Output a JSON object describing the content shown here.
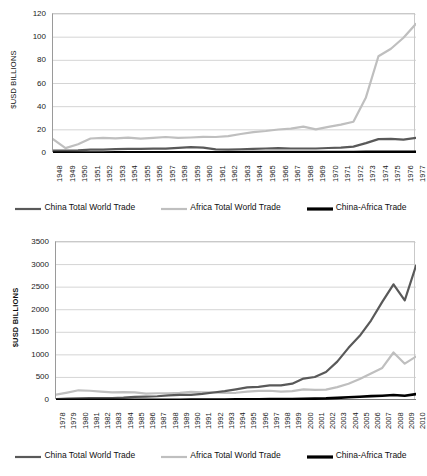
{
  "colors": {
    "china": "#595959",
    "africa": "#bfbfbf",
    "china_africa": "#000000",
    "gridline": "#c9c9c9",
    "axis": "#8c8c8c",
    "text": "#1a1a1a",
    "background": "#ffffff"
  },
  "legend": {
    "items": [
      {
        "label": "China Total World Trade",
        "color_key": "china",
        "thickness": 2.2
      },
      {
        "label": "Africa Total World Trade",
        "color_key": "africa",
        "thickness": 2.2
      },
      {
        "label": "China-Africa Trade",
        "color_key": "china_africa",
        "thickness": 3.2
      }
    ]
  },
  "chart_data": [
    {
      "id": "chart-1948-1977",
      "type": "line",
      "title": "",
      "xlabel": "",
      "ylabel": "$USD BILLIONS",
      "ylim": [
        0,
        120
      ],
      "yticks": [
        0,
        20,
        40,
        60,
        80,
        100,
        120
      ],
      "grid": true,
      "legend_position": "bottom",
      "categories": [
        "1948",
        "1949",
        "1950",
        "1951",
        "1952",
        "1953",
        "1954",
        "1955",
        "1956",
        "1957",
        "1958",
        "1959",
        "1960",
        "1961",
        "1962",
        "1963",
        "1964",
        "1965",
        "1966",
        "1967",
        "1968",
        "1969",
        "1970",
        "1971",
        "1972",
        "1973",
        "1974",
        "1975",
        "1976",
        "1977"
      ],
      "series": [
        {
          "name": "China Total World Trade",
          "color_key": "china",
          "values": [
            2.1,
            2.0,
            2.2,
            3.0,
            3.0,
            3.4,
            3.5,
            3.6,
            3.8,
            3.8,
            4.5,
            5.0,
            4.6,
            3.1,
            3.0,
            3.2,
            3.5,
            3.9,
            4.2,
            3.9,
            3.9,
            3.9,
            4.3,
            4.7,
            5.5,
            8.5,
            12.0,
            12.2,
            11.5,
            13.0
          ]
        },
        {
          "name": "Africa Total World Trade",
          "color_key": "africa",
          "values": [
            12.0,
            4.2,
            7.5,
            12.5,
            13.0,
            12.6,
            13.2,
            12.4,
            13.0,
            13.8,
            13.0,
            13.4,
            14.0,
            13.8,
            14.6,
            16.4,
            18.0,
            19.0,
            20.3,
            21.0,
            22.8,
            20.4,
            22.5,
            24.5,
            27.0,
            48.0,
            83.5,
            90.0,
            99.5,
            111.5
          ]
        },
        {
          "name": "China-Africa Trade",
          "color_key": "china_africa",
          "values": [
            0.3,
            0.3,
            0.3,
            0.4,
            0.4,
            0.5,
            0.5,
            0.5,
            0.6,
            0.6,
            0.7,
            0.7,
            0.7,
            0.6,
            0.6,
            0.7,
            0.8,
            0.8,
            0.8,
            0.8,
            0.8,
            0.8,
            0.9,
            0.9,
            0.9,
            1.0,
            1.0,
            1.0,
            1.0,
            1.1
          ]
        }
      ]
    },
    {
      "id": "chart-1978-2010",
      "type": "line",
      "title": "",
      "xlabel": "",
      "ylabel": "$USD BILLIONS",
      "ylim": [
        0,
        3500
      ],
      "yticks": [
        0,
        500,
        1000,
        1500,
        2000,
        2500,
        3000,
        3500
      ],
      "grid": true,
      "legend_position": "bottom",
      "categories": [
        "1978",
        "1979",
        "1980",
        "1981",
        "1982",
        "1983",
        "1984",
        "1985",
        "1986",
        "1987",
        "1988",
        "1989",
        "1990",
        "1991",
        "1992",
        "1993",
        "1994",
        "1995",
        "1996",
        "1997",
        "1998",
        "1999",
        "2000",
        "2001",
        "2002",
        "2003",
        "2004",
        "2005",
        "2006",
        "2007",
        "2008",
        "2009",
        "2010"
      ],
      "series": [
        {
          "name": "China Total World Trade",
          "color_key": "china",
          "values": [
            21,
            29,
            38,
            44,
            42,
            44,
            54,
            70,
            74,
            83,
            103,
            112,
            115,
            136,
            166,
            196,
            237,
            281,
            290,
            325,
            324,
            361,
            474,
            510,
            621,
            851,
            1155,
            1422,
            1760,
            2174,
            2563,
            2208,
            2974
          ]
        },
        {
          "name": "Africa Total World Trade",
          "color_key": "africa",
          "values": [
            120,
            165,
            215,
            205,
            185,
            170,
            175,
            170,
            140,
            150,
            150,
            160,
            180,
            170,
            170,
            155,
            160,
            185,
            200,
            205,
            185,
            195,
            235,
            225,
            230,
            285,
            360,
            465,
            585,
            710,
            1052,
            805,
            962
          ]
        },
        {
          "name": "China-Africa Trade",
          "color_key": "china_africa",
          "values": [
            2,
            3,
            3,
            4,
            4,
            4,
            5,
            5,
            5,
            5,
            6,
            7,
            9,
            10,
            11,
            12,
            14,
            16,
            18,
            20,
            21,
            22,
            26,
            30,
            35,
            46,
            60,
            73,
            85,
            95,
            110,
            95,
            130
          ]
        }
      ]
    }
  ]
}
